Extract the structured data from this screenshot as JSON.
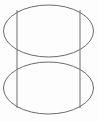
{
  "figure": {
    "kind": "geometric-line-drawing",
    "width": 99,
    "height": 122,
    "background_color": "#fdfdfd",
    "stroke_color": "#6b6b6b",
    "stroke_width": 1,
    "shapes": [
      {
        "name": "upper-ellipse",
        "type": "ellipse",
        "cx": 48.5,
        "cy": 31,
        "rx": 45,
        "ry": 26,
        "stroke": "#6b6b6b"
      },
      {
        "name": "lower-ellipse",
        "type": "ellipse",
        "cx": 48.5,
        "cy": 88,
        "rx": 45,
        "ry": 26,
        "stroke": "#6b6b6b"
      },
      {
        "name": "left-vertical-line",
        "type": "line",
        "x1": 17,
        "y1": 10,
        "x2": 17,
        "y2": 108,
        "stroke": "#6f6f6f"
      },
      {
        "name": "right-vertical-line",
        "type": "line",
        "x1": 80,
        "y1": 10,
        "x2": 80,
        "y2": 108,
        "stroke": "#6f6f6f"
      }
    ],
    "labels": [],
    "annotations": []
  }
}
